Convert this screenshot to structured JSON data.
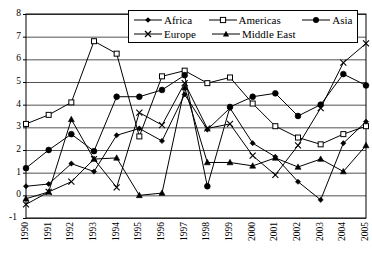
{
  "chart_data": {
    "type": "line",
    "title": "",
    "subtitle": "",
    "xlabel": "",
    "ylabel": "",
    "xlim": [
      1990,
      2005
    ],
    "ylim": [
      -1,
      8
    ],
    "ytick_step": 1,
    "grid": true,
    "grid_axis": "y",
    "legend_position": "top-center-inside",
    "categories": [
      "1990",
      "1991",
      "1992",
      "1993",
      "1994",
      "1995",
      "1996",
      "1997",
      "1998",
      "1999",
      "2000",
      "2001",
      "2002",
      "2003",
      "2004",
      "2005"
    ],
    "yticks": [
      "-1",
      "0",
      "1",
      "2",
      "3",
      "4",
      "5",
      "6",
      "7",
      "8"
    ],
    "series": [
      {
        "name": "Africa",
        "marker": "diamond-small",
        "color": "#000000",
        "values": [
          0.4,
          0.5,
          1.4,
          1.05,
          2.65,
          2.95,
          2.4,
          4.45,
          2.9,
          3.85,
          2.3,
          1.7,
          0.6,
          -0.2,
          2.3,
          3.25
        ]
      },
      {
        "name": "Americas",
        "marker": "open-square",
        "color": "#000000",
        "values": [
          3.15,
          3.55,
          4.1,
          6.8,
          6.25,
          2.6,
          5.25,
          5.5,
          4.95,
          5.2,
          4.05,
          3.05,
          2.55,
          2.25,
          2.7,
          3.05
        ]
      },
      {
        "name": "Asia",
        "marker": "filled-circle",
        "color": "#000000",
        "values": [
          1.2,
          2.0,
          2.7,
          1.95,
          4.35,
          4.35,
          4.65,
          5.3,
          0.4,
          3.9,
          4.35,
          4.5,
          3.5,
          4.0,
          5.35,
          4.85
        ]
      },
      {
        "name": "Europe",
        "marker": "cross",
        "color": "#000000",
        "values": [
          -0.4,
          0.15,
          0.6,
          1.6,
          0.35,
          3.65,
          3.1,
          4.95,
          2.95,
          3.15,
          1.75,
          0.9,
          2.2,
          3.85,
          5.85,
          6.7
        ]
      },
      {
        "name": "Middle East",
        "marker": "filled-triangle",
        "color": "#000000",
        "values": [
          -0.15,
          0.15,
          3.35,
          1.6,
          1.65,
          0.0,
          0.1,
          4.75,
          1.45,
          1.45,
          1.3,
          1.65,
          1.25,
          1.6,
          1.05,
          2.2
        ]
      }
    ]
  },
  "legend": {
    "items": [
      {
        "label": "Africa",
        "marker": "diamond-small"
      },
      {
        "label": "Americas",
        "marker": "open-square"
      },
      {
        "label": "Asia",
        "marker": "filled-circle"
      },
      {
        "label": "Europe",
        "marker": "cross"
      },
      {
        "label": "Middle East",
        "marker": "filled-triangle"
      }
    ]
  }
}
